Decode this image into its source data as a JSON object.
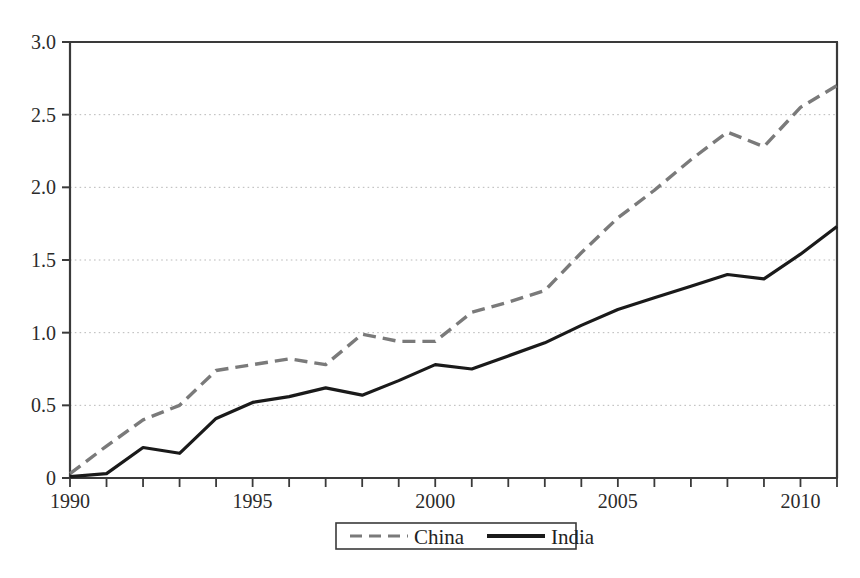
{
  "chart_data": {
    "type": "line",
    "title": "",
    "subtitle": "",
    "xlabel": "",
    "ylabel": "",
    "xlim": [
      1990,
      2011
    ],
    "ylim": [
      0,
      3.0
    ],
    "grid": true,
    "grid_axis": "y",
    "legend_position": "bottom-center",
    "x": [
      1990,
      1991,
      1992,
      1993,
      1994,
      1995,
      1996,
      1997,
      1998,
      1999,
      2000,
      2001,
      2002,
      2003,
      2004,
      2005,
      2006,
      2007,
      2008,
      2009,
      2010,
      2011
    ],
    "ytick_labels": [
      "0",
      "0.5",
      "1.0",
      "1.5",
      "2.0",
      "2.5",
      "3.0"
    ],
    "ytick_values": [
      0,
      0.5,
      1.0,
      1.5,
      2.0,
      2.5,
      3.0
    ],
    "xtick_values": [
      1990,
      1991,
      1992,
      1993,
      1994,
      1995,
      1996,
      1997,
      1998,
      1999,
      2000,
      2001,
      2002,
      2003,
      2004,
      2005,
      2006,
      2007,
      2008,
      2009,
      2010,
      2011
    ],
    "xtick_labels_shown": [
      "1990",
      "1995",
      "2000",
      "2005",
      "2010"
    ],
    "xtick_labeled_values": [
      1990,
      1995,
      2000,
      2005,
      2010
    ],
    "series": [
      {
        "name": "China",
        "style": "dashed",
        "color": "#7a7a7a",
        "values": [
          0.03,
          0.22,
          0.4,
          0.5,
          0.74,
          0.78,
          0.82,
          0.78,
          0.99,
          0.94,
          0.94,
          1.14,
          1.21,
          1.29,
          1.55,
          1.79,
          1.98,
          2.19,
          2.38,
          2.28,
          2.55,
          2.7
        ]
      },
      {
        "name": "India",
        "style": "solid",
        "color": "#1a1a1a",
        "values": [
          0.01,
          0.03,
          0.21,
          0.17,
          0.41,
          0.52,
          0.56,
          0.62,
          0.57,
          0.67,
          0.78,
          0.75,
          0.84,
          0.93,
          1.05,
          1.16,
          1.24,
          1.32,
          1.4,
          1.37,
          1.54,
          1.73
        ]
      }
    ]
  },
  "legend": {
    "items": [
      {
        "label": "China",
        "style": "dashed",
        "color": "#7a7a7a"
      },
      {
        "label": "India",
        "style": "solid",
        "color": "#1a1a1a"
      }
    ]
  },
  "colors": {
    "china_line": "#7a7a7a",
    "india_line": "#1a1a1a",
    "axis": "#3a3a3a",
    "grid": "#b9b9b9",
    "background": "#ffffff"
  }
}
